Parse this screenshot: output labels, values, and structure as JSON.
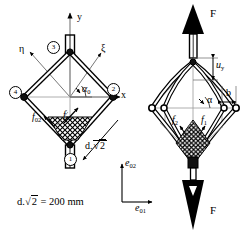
{
  "figure": {
    "colors": {
      "ink": "#000000",
      "paper": "#ffffff",
      "thin_line": "#888888"
    }
  },
  "left_diagram": {
    "name": "undeformed-configuration",
    "axes": [
      {
        "id": "y",
        "label": "y",
        "orientation": "vertical-up"
      },
      {
        "id": "x",
        "label": "x",
        "orientation": "horizontal-right"
      },
      {
        "id": "xi",
        "label": "ξ",
        "orientation": "diagonal-up-right"
      },
      {
        "id": "eta",
        "label": "η",
        "orientation": "diagonal-up-left"
      }
    ],
    "nodes": [
      {
        "id": "1",
        "label": "1",
        "position": "bottom"
      },
      {
        "id": "2",
        "label": "2",
        "position": "right"
      },
      {
        "id": "3",
        "label": "3",
        "position": "top"
      },
      {
        "id": "4",
        "label": "4",
        "position": "left"
      }
    ],
    "angle": {
      "symbol": "α",
      "subscript": "0",
      "label": "α0"
    },
    "forces": [
      {
        "symbol": "f",
        "subscript": "01",
        "label": "f01",
        "position": "inner-right"
      },
      {
        "symbol": "f",
        "subscript": "02",
        "label": "f02",
        "position": "inner-left"
      }
    ],
    "dimension": {
      "symbol": "d.√2",
      "label": "d√2",
      "position": "lower-right-leader"
    },
    "caption": {
      "lhs": "d.",
      "radicand": "2",
      "eq": "=",
      "value": "200",
      "unit": "mm",
      "full": "d.√2 = 200 mm"
    }
  },
  "right_diagram": {
    "name": "loaded-configuration",
    "loads": [
      {
        "symbol": "F",
        "label": "F",
        "position": "top",
        "direction": "up"
      },
      {
        "symbol": "F",
        "label": "F",
        "position": "bottom",
        "direction": "down"
      }
    ],
    "displacement": {
      "symbol": "u",
      "subscript": "y",
      "label": "uy"
    },
    "dimension_b": {
      "symbol": "b",
      "label": "b"
    },
    "angle": {
      "symbol": "α",
      "label": "α"
    },
    "forces": [
      {
        "symbol": "f",
        "subscript": "1",
        "label": "f1",
        "position": "inner-right"
      },
      {
        "symbol": "f",
        "subscript": "2",
        "label": "f2",
        "position": "inner-left"
      }
    ],
    "global_frame": [
      {
        "symbol": "e",
        "subscript": "01",
        "label": "e01",
        "orientation": "horizontal-right"
      },
      {
        "symbol": "e",
        "subscript": "02",
        "label": "e02",
        "orientation": "vertical-up"
      }
    ]
  }
}
